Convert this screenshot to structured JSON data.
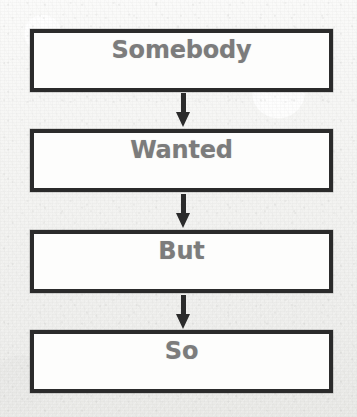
{
  "organizer": {
    "title": "Somebody Wanted But So",
    "background_color": "#f2f2f0",
    "box_border_color": "#2b2b2b",
    "box_fill_color": "#fdfdfc",
    "label_color": "#7c7c7c",
    "arrow_color": "#2b2b2b",
    "steps": [
      {
        "label": "Somebody",
        "value": ""
      },
      {
        "label": "Wanted",
        "value": ""
      },
      {
        "label": "But",
        "value": ""
      },
      {
        "label": "So",
        "value": ""
      }
    ],
    "connectors": [
      {
        "icon": "arrow-down-icon"
      },
      {
        "icon": "arrow-down-icon"
      },
      {
        "icon": "arrow-down-icon"
      }
    ]
  }
}
